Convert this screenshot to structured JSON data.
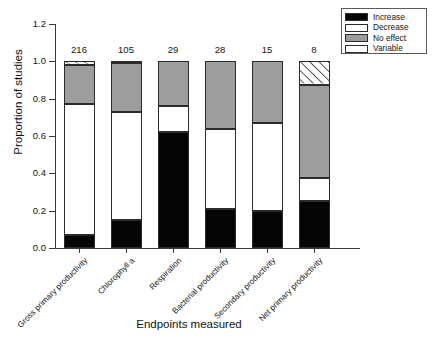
{
  "chart_data": {
    "type": "bar",
    "subtype": "stacked-proportion",
    "title": "",
    "xlabel": "Endpoints measured",
    "ylabel": "Proportion of studies",
    "ylim": [
      0.0,
      1.2
    ],
    "yticks": [
      "0.0",
      "0.2",
      "0.4",
      "0.6",
      "0.8",
      "1.0",
      "1.2"
    ],
    "ytick_values": [
      0.0,
      0.2,
      0.4,
      0.6,
      0.8,
      1.0,
      1.2
    ],
    "grid": false,
    "legend_position": "top-right",
    "categories": [
      "Gross primary productivity",
      "Chlorophyll a",
      "Respiration",
      "Bacterial productivity",
      "Secondary productivity",
      "Net primary productivity"
    ],
    "sample_sizes": [
      216,
      105,
      29,
      28,
      15,
      8
    ],
    "series": [
      {
        "name": "Increase",
        "color": "#050505",
        "values": [
          0.07,
          0.15,
          0.62,
          0.21,
          0.2,
          0.25
        ]
      },
      {
        "name": "Decrease",
        "color": "#ffffff",
        "values": [
          0.7,
          0.58,
          0.14,
          0.43,
          0.47,
          0.125
        ]
      },
      {
        "name": "No effect",
        "color": "#9d9d9d",
        "values": [
          0.21,
          0.26,
          0.24,
          0.36,
          0.33,
          0.5
        ]
      },
      {
        "name": "Variable",
        "color": "#ffffff",
        "pattern": "diagonal-hatch",
        "values": [
          0.02,
          0.01,
          0.0,
          0.0,
          0.0,
          0.125
        ]
      }
    ]
  },
  "legend": {
    "items": [
      {
        "label": "Increase",
        "swatch": "solid-black"
      },
      {
        "label": "Decrease",
        "swatch": "solid-white"
      },
      {
        "label": "No effect",
        "swatch": "solid-gray"
      },
      {
        "label": "Variable",
        "swatch": "hatched"
      }
    ]
  }
}
